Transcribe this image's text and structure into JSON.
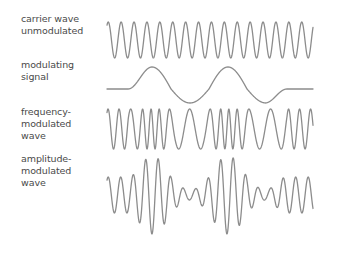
{
  "diagram": {
    "title": "",
    "rows": [
      {
        "id": "carrier",
        "label_lines": [
          "carrier wave",
          "unmodulated"
        ]
      },
      {
        "id": "modulating",
        "label_lines": [
          "modulating",
          "signal"
        ]
      },
      {
        "id": "fm",
        "label_lines": [
          "frequency-",
          "modulated",
          "wave"
        ]
      },
      {
        "id": "am",
        "label_lines": [
          "amplitude-",
          "modulated",
          "wave"
        ]
      }
    ],
    "colors": {
      "wave_stroke": "#8c8c8c",
      "label_text": "#4a4a4a",
      "background": "#ffffff"
    }
  },
  "wave_params": {
    "x_start": 107,
    "x_end": 313,
    "carrier": {
      "midline_y": 40,
      "amplitude": 18,
      "period_px": 12.9
    },
    "modulating": {
      "midline_y": 85,
      "amplitude": 18,
      "flat_y": 89,
      "flat_left_end_x": 128,
      "flat_right_start_x": 287,
      "peaks_x": [
        152,
        228
      ],
      "troughs_x": [
        190,
        265
      ]
    },
    "fm": {
      "midline_y": 129,
      "amplitude": 20,
      "min_period_px": 6,
      "max_period_px": 22
    },
    "am": {
      "midline_y": 195,
      "base_amplitude": 18,
      "max_amplitude": 39,
      "min_amplitude": 5,
      "period_px": 12.5
    }
  }
}
